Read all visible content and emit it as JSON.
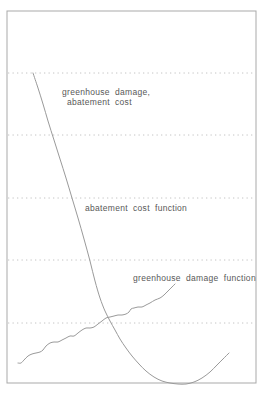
{
  "figure": {
    "background": "#ffffff",
    "frame_color": "#a9a9a9",
    "gridline_color": "#c4c4c4",
    "curve_color": "#9a9a9a",
    "text_color": "#585858"
  },
  "chart_data": {
    "type": "line",
    "title": "",
    "xlabel": "",
    "ylabel": "greenhouse damage, abatement cost",
    "axes_ticks_visible": false,
    "legend": "none",
    "grid": "horizontal dotted lines, evenly spaced",
    "frame_px": {
      "x": 7,
      "y": 11,
      "width": 249,
      "height": 372
    },
    "gridlines_y_px": [
      73,
      135,
      198,
      260,
      323
    ],
    "annotations": [
      {
        "id": "ylabel-line-1",
        "text": "greenhouse damage,",
        "x": 62,
        "y": 95
      },
      {
        "id": "ylabel-line-2",
        "text": "abatement cost",
        "x": 67,
        "y": 105
      },
      {
        "id": "abatement-label",
        "text": "abatement cost function",
        "x": 85,
        "y": 211
      },
      {
        "id": "damage-label",
        "text": "greenhouse damage function",
        "x": 133,
        "y": 281
      }
    ],
    "series": [
      {
        "name": "abatement cost function",
        "shape": "steep convex decline from upper left reaching a minimum that touches the bottom frame, then rising toward lower right (U-shape)",
        "points_px": [
          [
            33,
            73
          ],
          [
            38,
            88
          ],
          [
            43,
            104
          ],
          [
            48,
            121
          ],
          [
            54,
            140
          ],
          [
            60,
            159
          ],
          [
            66,
            178
          ],
          [
            72,
            198
          ],
          [
            78,
            218
          ],
          [
            84,
            239
          ],
          [
            90,
            261
          ],
          [
            95,
            281
          ],
          [
            100,
            298
          ],
          [
            105,
            311
          ],
          [
            110,
            321
          ],
          [
            115,
            330
          ],
          [
            120,
            339
          ],
          [
            126,
            348
          ],
          [
            132,
            356
          ],
          [
            139,
            364
          ],
          [
            146,
            371
          ],
          [
            154,
            377
          ],
          [
            162,
            381
          ],
          [
            170,
            383
          ],
          [
            178,
            384
          ],
          [
            186,
            384
          ],
          [
            194,
            382
          ],
          [
            202,
            378
          ],
          [
            210,
            372
          ],
          [
            217,
            365
          ],
          [
            223,
            359
          ],
          [
            229,
            353
          ]
        ]
      },
      {
        "name": "greenhouse damage function",
        "shape": "irregular stepped curve rising from lower left to middle right, crossing the abatement cost curve near the fifth gridline",
        "points_px": [
          [
            18,
            363
          ],
          [
            21,
            363
          ],
          [
            24,
            360
          ],
          [
            28,
            356
          ],
          [
            32,
            354
          ],
          [
            36,
            353
          ],
          [
            40,
            352
          ],
          [
            43,
            350
          ],
          [
            46,
            346
          ],
          [
            50,
            343
          ],
          [
            54,
            342
          ],
          [
            58,
            342
          ],
          [
            62,
            340
          ],
          [
            66,
            338
          ],
          [
            70,
            336
          ],
          [
            74,
            336
          ],
          [
            78,
            333
          ],
          [
            82,
            330
          ],
          [
            86,
            328
          ],
          [
            90,
            328
          ],
          [
            94,
            327
          ],
          [
            98,
            324
          ],
          [
            102,
            321
          ],
          [
            106,
            318
          ],
          [
            110,
            317
          ],
          [
            114,
            316
          ],
          [
            118,
            315
          ],
          [
            122,
            315
          ],
          [
            126,
            314
          ],
          [
            129,
            312
          ],
          [
            131,
            309
          ],
          [
            134,
            308
          ],
          [
            138,
            307
          ],
          [
            142,
            307
          ],
          [
            146,
            305
          ],
          [
            150,
            303
          ],
          [
            155,
            300
          ],
          [
            160,
            298
          ],
          [
            164,
            295
          ],
          [
            168,
            291
          ],
          [
            172,
            287
          ],
          [
            175,
            284
          ]
        ]
      }
    ]
  }
}
